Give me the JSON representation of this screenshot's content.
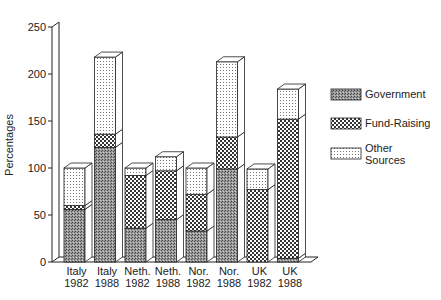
{
  "chart_data": {
    "type": "bar",
    "stacked": true,
    "style": "3d",
    "title": "",
    "xlabel": "",
    "ylabel": "Percentages",
    "ylim": [
      0,
      250
    ],
    "yticks": [
      0,
      50,
      100,
      150,
      200,
      250
    ],
    "grid": false,
    "legend_position": "right",
    "categories": [
      "Italy 1982",
      "Italy 1988",
      "Neth. 1982",
      "Neth. 1988",
      "Nor. 1982",
      "Nor. 1988",
      "UK 1982",
      "UK 1988"
    ],
    "category_lines": [
      [
        "Italy",
        "1982"
      ],
      [
        "Italy",
        "1988"
      ],
      [
        "Neth.",
        "1982"
      ],
      [
        "Neth.",
        "1988"
      ],
      [
        "Nor.",
        "1982"
      ],
      [
        "Nor.",
        "1988"
      ],
      [
        "UK",
        "1982"
      ],
      [
        "UK",
        "1988"
      ]
    ],
    "series": [
      {
        "name": "Government",
        "pattern": "dense-gray",
        "values": [
          56,
          122,
          36,
          45,
          33,
          99,
          0,
          4
        ]
      },
      {
        "name": "Fund-Raising",
        "pattern": "checker",
        "values": [
          4,
          14,
          56,
          52,
          39,
          34,
          77,
          148
        ]
      },
      {
        "name": "Other Sources",
        "pattern": "sparse-dots",
        "values": [
          40,
          82,
          8,
          15,
          28,
          80,
          22,
          32
        ]
      }
    ],
    "totals": [
      100,
      218,
      100,
      112,
      100,
      213,
      99,
      184
    ]
  },
  "legend": {
    "items": [
      {
        "lines": [
          "Government"
        ]
      },
      {
        "lines": [
          "Fund-Raising"
        ]
      },
      {
        "lines": [
          "Other",
          "Sources"
        ]
      }
    ]
  }
}
